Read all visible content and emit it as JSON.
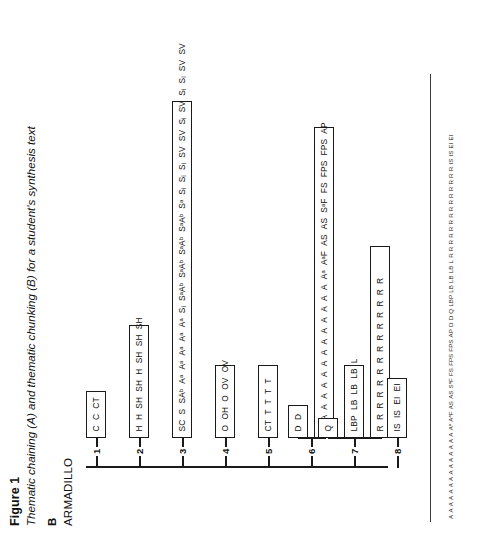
{
  "caption": {
    "figure_number": "Figure 1",
    "title": "Thematic chaining (A) and thematic chunking (B) for a student's synthesis text"
  },
  "root": {
    "panel_label": "B",
    "word": "ARMADILLO"
  },
  "tree": {
    "nodes": [
      {
        "number": "1",
        "boxes": [
          {
            "items": [
              "C",
              "C",
              "CT"
            ]
          }
        ]
      },
      {
        "number": "2",
        "boxes": [
          {
            "items": [
              "H",
              "H",
              "SH",
              "SH",
              "H",
              "SH",
              "SH",
              "SH"
            ]
          }
        ]
      },
      {
        "number": "3",
        "boxes": [
          {
            "items": [
              "SC",
              "S",
              "SAᵇ",
              "Aᵃ",
              "Aᵃ",
              "Aᵃ",
              "Aᵃ",
              "Aᵃ",
              "Sᵢ",
              "SᵃAᵇ",
              "SᵃAᵇ",
              "SᵃAᵇ",
              "SᵃAᵇ",
              "Sᵃ",
              "Sᵢ",
              "Sᵢ",
              "Sᵢ",
              "SV",
              "SV",
              "Sᵢ",
              "SV",
              "Sᵢ",
              "Sᵢ",
              "SV",
              "SV"
            ]
          }
        ]
      },
      {
        "number": "4",
        "boxes": [
          {
            "items": [
              "O",
              "OH",
              "O",
              "OV",
              "OV"
            ]
          }
        ]
      },
      {
        "number": "5",
        "boxes": [
          {
            "items": [
              "CT",
              "T",
              "T",
              "T",
              "T"
            ]
          }
        ]
      },
      {
        "number": "6",
        "boxes": [
          {
            "items": [
              "D",
              "D"
            ]
          },
          {
            "items": [
              "A",
              "A",
              "A",
              "A",
              "A",
              "A",
              "A",
              "A",
              "A",
              "A",
              "A",
              "A",
              "A",
              "A",
              "Aᵃ",
              "AᵃF",
              "AS",
              "AS",
              "SᵃF",
              "FS",
              "FPS",
              "FPS",
              "AP"
            ]
          }
        ]
      },
      {
        "number": "7",
        "boxes": [
          {
            "items": [
              "Q"
            ]
          },
          {
            "items": [
              "LBP",
              "LB",
              "LB",
              "LB",
              "L"
            ]
          },
          {
            "items": [
              "R",
              "R",
              "R",
              "R",
              "R",
              "R",
              "R",
              "R",
              "R",
              "R",
              "R",
              "R",
              "R",
              "R"
            ]
          }
        ]
      },
      {
        "number": "8",
        "boxes": [
          {
            "items": [
              "IS",
              "IS",
              "EI",
              "EI"
            ]
          }
        ]
      }
    ]
  },
  "footer_strip": {
    "items": [
      "A",
      "A",
      "A",
      "A",
      "A",
      "A",
      "A",
      "A",
      "A",
      "A",
      "A",
      "A",
      "A",
      "A",
      "Aᵃ",
      "AᵃF",
      "AS",
      "AS",
      "SᵃF",
      "FS",
      "FPS",
      "FPS",
      "AP",
      "D",
      "D",
      "Q",
      "LBP",
      "LB",
      "LB",
      "LB",
      "L",
      "R",
      "R",
      "R",
      "R",
      "R",
      "R",
      "R",
      "R",
      "R",
      "R",
      "R",
      "R",
      "R",
      "R",
      "IS",
      "IS",
      "EI",
      "EI"
    ]
  },
  "colors": {
    "ink": "#1a1a1a",
    "paper": "#ffffff",
    "rule": "#3a3a3a"
  }
}
